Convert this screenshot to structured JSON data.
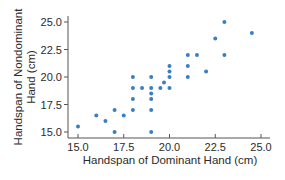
{
  "chart_data": {
    "type": "scatter",
    "title": "",
    "xlabel": "Handspan of Dominant Hand (cm)",
    "ylabel_lines": [
      "Handspan of Nondominant",
      "Hand (cm)"
    ],
    "ylabel": "Handspan of Nondominant Hand (cm)",
    "xlim": [
      14.5,
      25.3
    ],
    "ylim": [
      14.5,
      25.5
    ],
    "xticks": [
      15.0,
      17.5,
      20.0,
      22.5,
      25.0
    ],
    "yticks": [
      15.0,
      17.5,
      20.0,
      22.5,
      25.0
    ],
    "xtick_labels": [
      "15.0",
      "17.5",
      "20.0",
      "22.5",
      "25.0"
    ],
    "ytick_labels": [
      "15.0",
      "17.5",
      "20.0",
      "22.5",
      "25.0"
    ],
    "grid": false,
    "legend": null,
    "marker_color": "#3a7fc1",
    "axis_color": "#555555",
    "points": [
      {
        "x": 15.0,
        "y": 15.5
      },
      {
        "x": 16.0,
        "y": 16.5
      },
      {
        "x": 16.5,
        "y": 16.0
      },
      {
        "x": 17.0,
        "y": 17.0
      },
      {
        "x": 17.0,
        "y": 15.0
      },
      {
        "x": 17.5,
        "y": 16.5
      },
      {
        "x": 18.0,
        "y": 20.0
      },
      {
        "x": 18.0,
        "y": 19.0
      },
      {
        "x": 18.0,
        "y": 18.0
      },
      {
        "x": 18.0,
        "y": 17.0
      },
      {
        "x": 18.5,
        "y": 19.0
      },
      {
        "x": 19.0,
        "y": 20.0
      },
      {
        "x": 19.0,
        "y": 19.0
      },
      {
        "x": 19.0,
        "y": 18.5
      },
      {
        "x": 19.0,
        "y": 18.0
      },
      {
        "x": 19.0,
        "y": 17.0
      },
      {
        "x": 19.0,
        "y": 15.0
      },
      {
        "x": 19.5,
        "y": 19.0
      },
      {
        "x": 19.7,
        "y": 19.5
      },
      {
        "x": 20.0,
        "y": 21.0
      },
      {
        "x": 20.0,
        "y": 20.5
      },
      {
        "x": 20.0,
        "y": 20.0
      },
      {
        "x": 20.0,
        "y": 19.0
      },
      {
        "x": 21.0,
        "y": 22.0
      },
      {
        "x": 21.0,
        "y": 21.0
      },
      {
        "x": 21.0,
        "y": 20.0
      },
      {
        "x": 21.5,
        "y": 22.0
      },
      {
        "x": 22.0,
        "y": 20.5
      },
      {
        "x": 22.5,
        "y": 23.5
      },
      {
        "x": 23.0,
        "y": 25.0
      },
      {
        "x": 23.0,
        "y": 22.0
      },
      {
        "x": 24.5,
        "y": 24.0
      }
    ]
  }
}
